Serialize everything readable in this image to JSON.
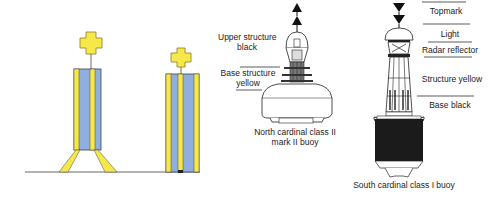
{
  "figure": {
    "colors": {
      "yellow": "#f7e84a",
      "blue": "#8fb0de",
      "black": "#1b1b1b",
      "outline": "#333333"
    },
    "left_panel": {
      "buoys": [
        {
          "name": "cardinal-buoy-legged",
          "topmark": "cross",
          "stripes": [
            "yellow",
            "blue",
            "yellow",
            "blue"
          ]
        },
        {
          "name": "cardinal-buoy-pillar",
          "topmark": "cross",
          "stripes": [
            "yellow",
            "blue",
            "yellow",
            "blue"
          ]
        }
      ]
    },
    "north_buoy": {
      "labels": {
        "upper_structure": "Upper structure black",
        "upper_structure_line1": "Upper structure",
        "upper_structure_line2": "black",
        "base_structure_line1": "Base structure",
        "base_structure_line2": "yellow"
      },
      "caption_line1": "North cardinal class II",
      "caption_line2": "mark II buoy",
      "topmark": "two cones pointing up"
    },
    "south_buoy": {
      "labels": {
        "topmark": "Topmark",
        "light": "Light",
        "radar_reflector": "Radar reflector",
        "structure": "Structure yellow",
        "base": "Base black"
      },
      "caption": "South cardinal class I buoy",
      "topmark": "two cones pointing down"
    }
  }
}
